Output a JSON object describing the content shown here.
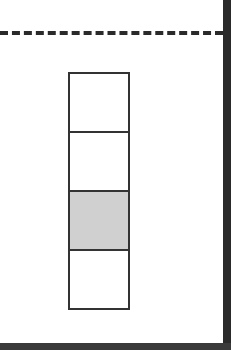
{
  "diagram": {
    "dashed_line": {
      "style": "dashed",
      "color": "#2a2a2a"
    },
    "stack": {
      "cells": [
        {
          "filled": false
        },
        {
          "filled": false
        },
        {
          "filled": true,
          "fill_color": "#d0d0d0"
        },
        {
          "filled": false
        }
      ]
    },
    "frame_color": "#2a2a2a"
  }
}
